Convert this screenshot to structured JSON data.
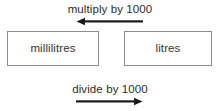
{
  "diagram": {
    "background_color": "#ffffff",
    "box_border_color": "#8d8d8d",
    "text_color": "#333333",
    "arrow_color": "#1a1a1a",
    "top": {
      "caption": "multiply by 1000",
      "arrow_icon": "arrow-left-icon",
      "arrow_direction": "left",
      "from": "litres",
      "to": "millilitres",
      "factor": 1000
    },
    "bottom": {
      "caption": "divide by 1000",
      "arrow_icon": "arrow-right-icon",
      "arrow_direction": "right",
      "from": "millilitres",
      "to": "litres",
      "factor": 1000
    },
    "boxes": [
      {
        "id": "millilitres",
        "label": "millilitres"
      },
      {
        "id": "litres",
        "label": "litres"
      }
    ]
  }
}
